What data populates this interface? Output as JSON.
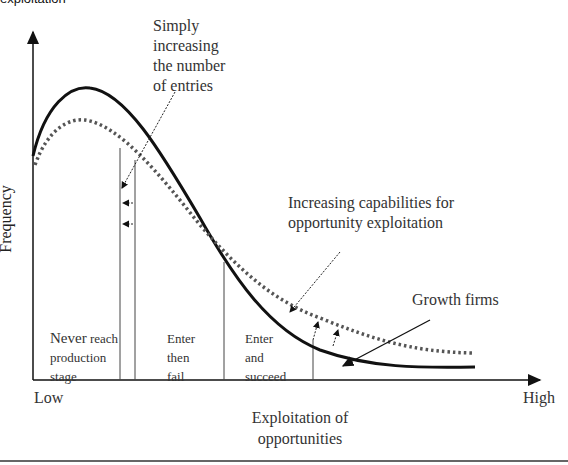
{
  "figure": {
    "top_caption_fragment": "exploitation",
    "y_axis_label": "Frequency",
    "x_axis_label_line1": "Exploitation of",
    "x_axis_label_line2": "opportunities",
    "x_low_label": "Low",
    "x_high_label": "High",
    "annotations": {
      "entries_line1": "Simply",
      "entries_line2": "increasing",
      "entries_line3": "the number",
      "entries_line4": "of entries",
      "capabilities_line1": "Increasing capabilities for",
      "capabilities_line2": "opportunity exploitation",
      "growth_firms": "Growth firms"
    },
    "regions": {
      "never_word": "Never",
      "never_rest": " reach",
      "never_line2": "production",
      "never_line3": "stage",
      "fail_line1": "Enter",
      "fail_line2": "then",
      "fail_line3": "fail",
      "succeed_line1": "Enter",
      "succeed_line2": "and",
      "succeed_line3": "succeed"
    },
    "curves": [
      {
        "name": "Original distribution",
        "style": "solid"
      },
      {
        "name": "Shifted distribution",
        "style": "dotted"
      }
    ],
    "colors": {
      "line": "#111111",
      "dotted": "#555555",
      "text": "#333333"
    }
  }
}
